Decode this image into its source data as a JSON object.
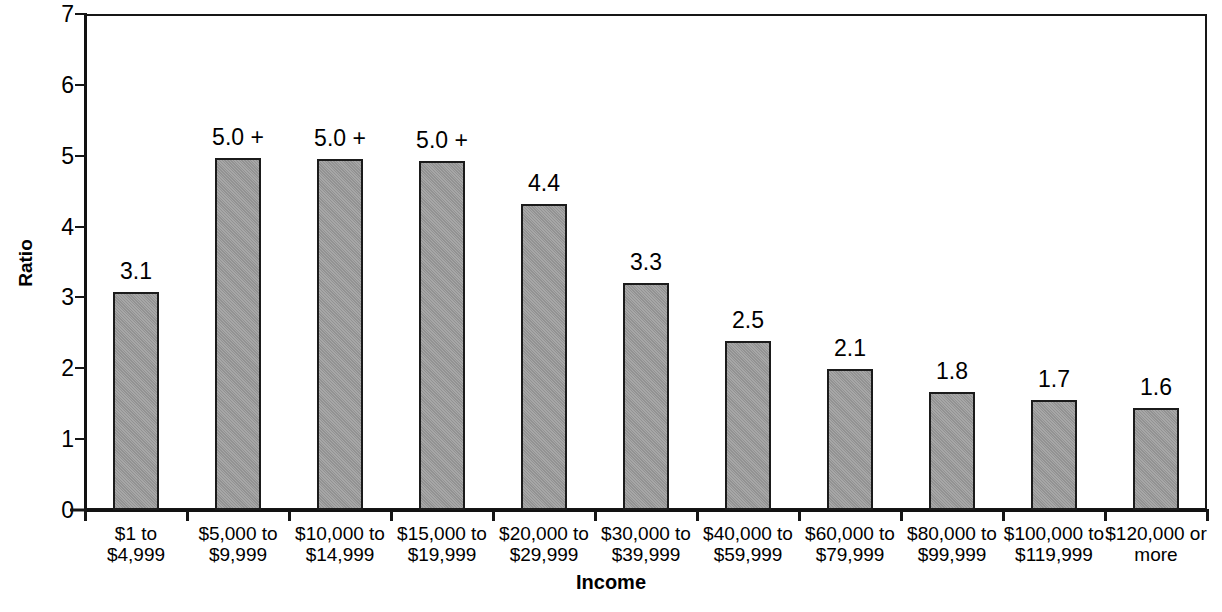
{
  "chart_data": {
    "type": "bar",
    "title": "",
    "xlabel": "Income",
    "ylabel": "Ratio",
    "ylim": [
      0,
      7
    ],
    "yticks": [
      0,
      1,
      2,
      3,
      4,
      5,
      6,
      7
    ],
    "ytick_labels": [
      "0",
      "1",
      "2",
      "3",
      "4",
      "5",
      "6",
      "7"
    ],
    "grid": false,
    "legend": "none",
    "bar_color": "#9a9a9a",
    "bar_edge_color": "#1b1b1b",
    "categories": [
      "$1 to $4,999",
      "$5,000 to $9,999",
      "$10,000 to $14,999",
      "$15,000 to $19,999",
      "$20,000 to $29,999",
      "$30,000 to $39,999",
      "$40,000 to $59,999",
      "$60,000 to $79,999",
      "$80,000 to $99,999",
      "$100,000 to $119,999",
      "$120,000 or more"
    ],
    "category_lines": [
      [
        "$1 to",
        "$4,999"
      ],
      [
        "$5,000 to",
        "$9,999"
      ],
      [
        "$10,000 to",
        "$14,999"
      ],
      [
        "$15,000 to",
        "$19,999"
      ],
      [
        "$20,000 to",
        "$29,999"
      ],
      [
        "$30,000 to",
        "$39,999"
      ],
      [
        "$40,000 to",
        "$59,999"
      ],
      [
        "$60,000 to",
        "$79,999"
      ],
      [
        "$80,000 to",
        "$99,999"
      ],
      [
        "$100,000 to",
        "$119,999"
      ],
      [
        "$120,000 or",
        "more"
      ]
    ],
    "values": [
      3.08,
      4.97,
      4.95,
      4.93,
      4.32,
      3.2,
      2.39,
      1.99,
      1.67,
      1.55,
      1.44
    ],
    "data_labels": [
      "3.1",
      "5.0 +",
      "5.0 +",
      "5.0 +",
      "4.4",
      "3.3",
      "2.5",
      "2.1",
      "1.8",
      "1.7",
      "1.6"
    ]
  }
}
